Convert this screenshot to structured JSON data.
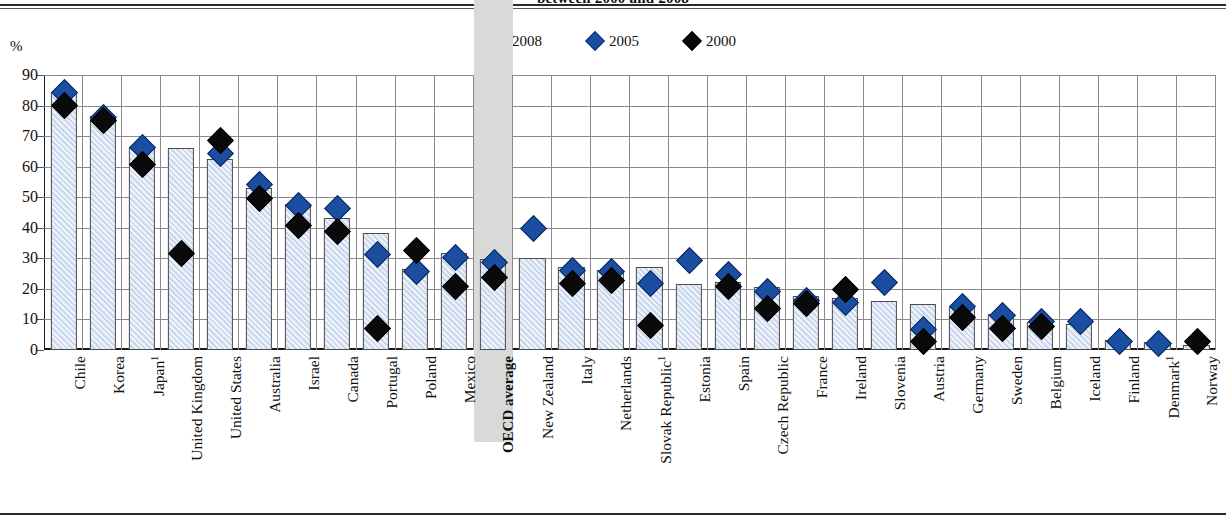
{
  "figure": {
    "title": "between 2000 and 2008",
    "axis_unit_label": "%",
    "bottom_rule": true
  },
  "legend": {
    "position": "top-center",
    "items": [
      {
        "label": "2008",
        "marker": "square",
        "color": "#ccd8ef",
        "icon": "legend-square-icon"
      },
      {
        "label": "2005",
        "marker": "diamond",
        "color": "#1b4ea0",
        "icon": "legend-diamond-blue-icon"
      },
      {
        "label": "2000",
        "marker": "diamond",
        "color": "#0a0a0a",
        "icon": "legend-diamond-black-icon"
      }
    ]
  },
  "chart_data": {
    "type": "bar",
    "title": "between 2000 and 2008",
    "xlabel": "",
    "ylabel": "%",
    "ylim": [
      0,
      90
    ],
    "yticks": [
      0,
      10,
      20,
      30,
      40,
      50,
      60,
      70,
      80,
      90
    ],
    "grid": true,
    "legend_position": "top-center",
    "highlight_category": "OECD average",
    "categories": [
      "Chile",
      "Korea",
      "Japan¹",
      "United Kingdom",
      "United States",
      "Australia",
      "Israel",
      "Canada",
      "Portugal",
      "Poland",
      "Mexico",
      "OECD average",
      "New Zealand",
      "Italy",
      "Netherlands",
      "Slovak Republic¹",
      "Estonia",
      "Spain",
      "Czech Republic",
      "France",
      "Ireland",
      "Slovenia",
      "Austria",
      "Germany",
      "Sweden",
      "Belgium",
      "Iceland",
      "Finland",
      "Denmark¹",
      "Norway"
    ],
    "series": [
      {
        "name": "2008",
        "type": "bar",
        "values": [
          83.5,
          76.0,
          65.5,
          65.5,
          62.0,
          52.5,
          47.0,
          42.5,
          37.5,
          26.0,
          31.0,
          29.0,
          29.5,
          26.5,
          25.5,
          26.5,
          21.0,
          21.5,
          20.0,
          17.0,
          16.5,
          15.5,
          14.5,
          13.5,
          11.0,
          8.5,
          8.0,
          2.5,
          2.0,
          1.0
        ]
      },
      {
        "name": "2005",
        "type": "marker",
        "values": [
          84.5,
          76.5,
          66.5,
          null,
          64.5,
          54.5,
          47.5,
          46.5,
          31.5,
          26.0,
          30.5,
          29.0,
          40.0,
          26.5,
          26.0,
          22.0,
          29.5,
          25.0,
          19.5,
          16.5,
          16.0,
          22.5,
          7.0,
          14.5,
          11.5,
          9.5,
          9.5,
          3.0,
          2.5,
          null
        ]
      },
      {
        "name": "2000",
        "type": "marker",
        "values": [
          80.5,
          75.5,
          61.0,
          32.0,
          69.0,
          50.0,
          41.0,
          39.0,
          7.5,
          33.0,
          21.0,
          24.0,
          null,
          22.0,
          23.0,
          8.5,
          null,
          21.0,
          14.0,
          15.5,
          20.0,
          null,
          3.0,
          11.0,
          7.5,
          8.0,
          null,
          null,
          null,
          3.0
        ]
      }
    ]
  }
}
